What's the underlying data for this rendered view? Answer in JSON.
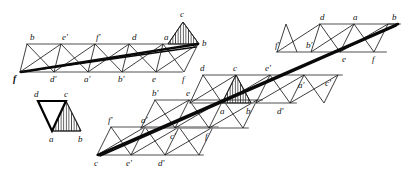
{
  "figure": {
    "type": "geometric-diagram",
    "background_color": "#ffffff",
    "rail_color": "#8a8a8a",
    "edge_color": "#1c1c1c",
    "fold_color": "#0a0a0a",
    "hatch_color": "#1c1c1c"
  },
  "strips": [
    {
      "name": "strip-top-left",
      "top_rail": {
        "y": 44,
        "x1": 27,
        "x2": 198
      },
      "bottom_rail": {
        "y": 72,
        "x1": 20,
        "x2": 182
      },
      "top_labels": [
        {
          "text": "b",
          "x": 30,
          "y": 40
        },
        {
          "text": "e′",
          "x": 62,
          "y": 40
        },
        {
          "text": "f′",
          "x": 96,
          "y": 40
        },
        {
          "text": "d",
          "x": 132,
          "y": 40
        },
        {
          "text": "a",
          "x": 164,
          "y": 40
        },
        {
          "text": "b",
          "x": 197,
          "y": 44
        }
      ],
      "bottom_labels": [
        {
          "text": "f",
          "x": 17,
          "y": 82,
          "bold": true
        },
        {
          "text": "d′",
          "x": 50,
          "y": 82
        },
        {
          "text": "a′",
          "x": 84,
          "y": 82
        },
        {
          "text": "b′",
          "x": 118,
          "y": 82
        },
        {
          "text": "e",
          "x": 152,
          "y": 82
        },
        {
          "text": "f",
          "x": 183,
          "y": 82
        }
      ],
      "shaded_triangle": {
        "apex_label": "c",
        "apex": [
          183,
          22
        ],
        "base_left": [
          168,
          44
        ],
        "base_right": [
          199,
          44
        ]
      },
      "apex_label": {
        "text": "c",
        "x": 181,
        "y": 17
      }
    },
    {
      "name": "strip-small-detached",
      "labels": [
        {
          "text": "d",
          "x": 34,
          "y": 97
        },
        {
          "text": "c",
          "x": 65,
          "y": 97
        },
        {
          "text": "a",
          "x": 48,
          "y": 142
        },
        {
          "text": "b",
          "x": 78,
          "y": 142
        }
      ],
      "vertices": {
        "d": [
          38,
          101
        ],
        "c": [
          66,
          101
        ],
        "a": [
          52,
          131
        ],
        "b": [
          81,
          131
        ]
      }
    },
    {
      "name": "strip-lower-left",
      "top_rail": {
        "y": 127,
        "x1": 111,
        "x2": 215
      },
      "bottom_rail": {
        "y": 155,
        "x1": 97,
        "x2": 200
      },
      "top_labels": [
        {
          "text": "f′",
          "x": 110,
          "y": 123
        },
        {
          "text": "a′",
          "x": 143,
          "y": 123
        }
      ],
      "bottom_labels": [
        {
          "text": "c",
          "x": 94,
          "y": 166
        },
        {
          "text": "e′",
          "x": 128,
          "y": 166
        },
        {
          "text": "d′",
          "x": 160,
          "y": 166
        }
      ]
    },
    {
      "name": "strip-middle-lower",
      "top_rail": {
        "y": 100,
        "x1": 155,
        "x2": 260
      },
      "bottom_rail": {
        "y": 128,
        "x1": 141,
        "x2": 245
      },
      "top_labels": [
        {
          "text": "b′",
          "x": 155,
          "y": 96
        },
        {
          "text": "e",
          "x": 188,
          "y": 96
        }
      ],
      "bottom_labels": [
        {
          "text": "c′",
          "x": 173,
          "y": 139
        },
        {
          "text": "f",
          "x": 206,
          "y": 139
        }
      ]
    },
    {
      "name": "strip-middle",
      "top_rail": {
        "y": 75,
        "x1": 203,
        "x2": 340
      },
      "bottom_rail": {
        "y": 103,
        "x1": 190,
        "x2": 325
      },
      "top_labels": [
        {
          "text": "d",
          "x": 201,
          "y": 71
        },
        {
          "text": "c",
          "x": 234,
          "y": 71
        },
        {
          "text": "e′",
          "x": 266,
          "y": 71
        },
        {
          "text": "a′",
          "x": 300,
          "y": 88
        },
        {
          "text": "c′",
          "x": 325,
          "y": 85
        }
      ],
      "bottom_labels": [
        {
          "text": "a",
          "x": 222,
          "y": 114
        },
        {
          "text": "b",
          "x": 248,
          "y": 114
        },
        {
          "text": "d′",
          "x": 280,
          "y": 114
        }
      ],
      "shaded_triangle": {
        "apex_label": "c",
        "apex": [
          236,
          75
        ],
        "base_left": [
          222,
          103
        ],
        "base_right": [
          251,
          103
        ]
      }
    },
    {
      "name": "strip-top-right",
      "top_rail": {
        "y": 24,
        "x1": 320,
        "x2": 398
      },
      "bottom_rail": {
        "y": 52,
        "x1": 277,
        "x2": 385
      },
      "top_labels": [
        {
          "text": "d",
          "x": 322,
          "y": 20
        },
        {
          "text": "a",
          "x": 354,
          "y": 20
        },
        {
          "text": "b",
          "x": 390,
          "y": 20
        }
      ],
      "bottom_labels": [
        {
          "text": "f′",
          "x": 277,
          "y": 48
        },
        {
          "text": "b′",
          "x": 308,
          "y": 48
        },
        {
          "text": "e",
          "x": 344,
          "y": 62
        },
        {
          "text": "f",
          "x": 374,
          "y": 62
        }
      ]
    }
  ],
  "fold_lines": [
    {
      "name": "fold-left-strip",
      "from": [
        21,
        72
      ],
      "to": [
        198,
        44
      ]
    },
    {
      "name": "fold-left-strip-secondary",
      "from": [
        21,
        72
      ],
      "to": [
        196,
        46
      ]
    },
    {
      "name": "fold-main-diagonal",
      "from": [
        98,
        155
      ],
      "to": [
        398,
        24
      ]
    }
  ]
}
